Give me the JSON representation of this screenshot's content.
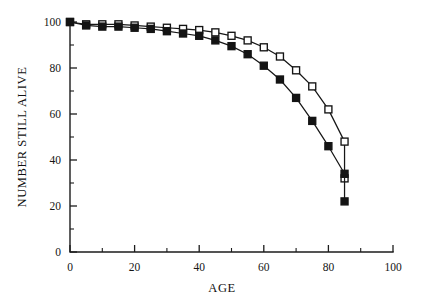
{
  "chart_data": {
    "type": "line",
    "title": "",
    "subtitle": "",
    "xlabel": "AGE",
    "ylabel": "NUMBER STILL ALIVE",
    "xlim": [
      0,
      100
    ],
    "ylim": [
      0,
      100
    ],
    "xticks": [
      0,
      20,
      40,
      60,
      80,
      100
    ],
    "xtick_labels": [
      "0",
      "20",
      "40",
      "60",
      "80",
      "100"
    ],
    "xminor_ticks": [
      10,
      30,
      50,
      70,
      90
    ],
    "yticks": [
      0,
      20,
      40,
      60,
      80,
      100
    ],
    "ytick_labels": [
      "0",
      "20",
      "40",
      "60",
      "80",
      "100"
    ],
    "yminor_ticks": [
      10,
      30,
      50,
      70,
      90
    ],
    "grid": false,
    "legend": null,
    "legend_position": "none",
    "x": [
      0,
      5,
      10,
      15,
      20,
      25,
      30,
      35,
      40,
      45,
      50,
      55,
      60,
      65,
      70,
      75,
      80,
      85
    ],
    "series": [
      {
        "name": "open-square-series",
        "marker": "open-square",
        "color": "#141414",
        "values": [
          100,
          99,
          99,
          99,
          98.5,
          98,
          97.5,
          97,
          96.5,
          95.5,
          94,
          92,
          89,
          85,
          79,
          72,
          62,
          48,
          32
        ],
        "x": [
          0,
          5,
          10,
          15,
          20,
          25,
          30,
          35,
          40,
          45,
          50,
          55,
          60,
          65,
          70,
          75,
          80,
          85,
          85
        ]
      },
      {
        "name": "filled-square-series",
        "marker": "filled-square",
        "color": "#141414",
        "values": [
          100,
          98.5,
          98,
          98,
          97.5,
          97,
          96,
          95,
          94,
          92,
          89.5,
          86,
          81,
          75,
          67,
          57,
          46,
          34,
          22
        ],
        "x": [
          0,
          5,
          10,
          15,
          20,
          25,
          30,
          35,
          40,
          45,
          50,
          55,
          60,
          65,
          70,
          75,
          80,
          85,
          85
        ]
      }
    ],
    "annotations": []
  },
  "figure": {
    "background_color": "#ffffff",
    "axis_color": "#1c1c1c"
  }
}
